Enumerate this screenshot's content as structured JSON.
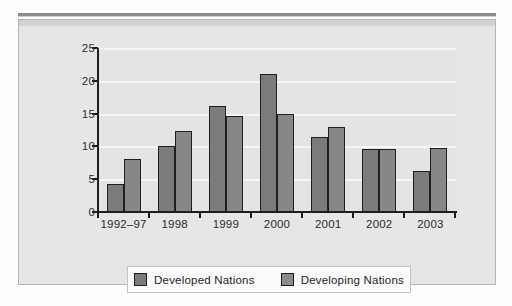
{
  "chart_data": {
    "type": "bar",
    "title": "",
    "subtitle": "",
    "xlabel": "",
    "ylabel": "",
    "categories": [
      "1992–97",
      "1998",
      "1999",
      "2000",
      "2001",
      "2002",
      "2003"
    ],
    "series": [
      {
        "name": "Developed Nations",
        "color": "#7b7b7b",
        "values": [
          4.3,
          10.0,
          16.2,
          21.1,
          11.4,
          9.6,
          6.3
        ]
      },
      {
        "name": "Developing Nations",
        "color": "#8b8b8b",
        "values": [
          8.1,
          12.3,
          14.6,
          15.0,
          12.9,
          9.6,
          9.8
        ]
      }
    ],
    "ylim": [
      0,
      25
    ],
    "yticks": [
      0,
      5,
      10,
      15,
      20,
      25
    ],
    "ytick_labels": [
      "0",
      "5",
      "10",
      "15",
      "20",
      "25"
    ],
    "grid": true,
    "grid_axis": "y",
    "legend_position": "bottom",
    "legend_entries": [
      "Developed Nations",
      "Developing Nations"
    ]
  },
  "legend": {
    "items": [
      {
        "label": "Developed Nations",
        "swatch": "legend-swatch-developed"
      },
      {
        "label": "Developing Nations",
        "swatch": "legend-swatch-developing"
      }
    ]
  },
  "colors": {
    "developed": "#7b7b7b",
    "developing": "#8b8b8b",
    "plot_background": "#e4e4e4",
    "figure_background": "#e6e6e6",
    "gridline": "#f6f6f6",
    "axis": "#1d1d1d",
    "text": "#2b2b2b"
  }
}
